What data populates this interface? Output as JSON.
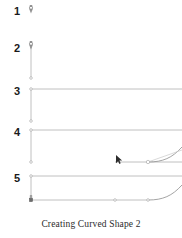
{
  "figure": {
    "caption": "Creating Curved Shape 2",
    "canvas": {
      "width": 182,
      "height": 238
    },
    "colors": {
      "line": "#b9b9b9",
      "line_dark": "#9a9a9a",
      "handle": "#c9c9c9",
      "anchor_fill": "#ffffff",
      "anchor_stroke": "#a0a0a0",
      "anchor_solid": "#6e6e6e",
      "cursor": "#2c2c2c",
      "number": "#1a1a1a",
      "caption": "#2b2b2b",
      "background": "#ffffff"
    },
    "steps": [
      {
        "number": "1",
        "label_x": 16,
        "label_y": 12,
        "description": "Pen tool placed at the starting point",
        "origin_x": 31,
        "origin_y": 11,
        "tool": "pen-tool",
        "has_vertical_line": false,
        "has_top_line": false,
        "has_bottom_line": false,
        "has_curve": false,
        "has_cursor": false
      },
      {
        "number": "2",
        "label_x": 16,
        "label_y": 50,
        "description": "Vertical line dragged downward from the start point",
        "origin_x": 31,
        "origin_y": 47,
        "vertical_end_y": 78,
        "tool": "pen-tool",
        "has_vertical_line": true,
        "has_top_line": false,
        "has_bottom_line": false,
        "has_curve": false,
        "has_cursor": false
      },
      {
        "number": "3",
        "label_x": 16,
        "label_y": 93,
        "description": "Horizontal top line added extending to the right edge",
        "origin_x": 31,
        "origin_y": 89,
        "vertical_end_y": 121,
        "top_line_end_x": 182,
        "tool": "anchor-point",
        "has_vertical_line": true,
        "has_top_line": true,
        "has_bottom_line": false,
        "has_curve": false,
        "has_cursor": false
      },
      {
        "number": "4",
        "label_x": 16,
        "label_y": 134,
        "description": "Bottom segment drawn and curve handle pulled up at the right",
        "origin_x": 31,
        "origin_y": 130,
        "vertical_end_y": 162,
        "top_line_end_x": 182,
        "bottom_line_start_x": 115,
        "bottom_line_end_x": 182,
        "bottom_line_y": 162,
        "curve_start_x": 148,
        "curve_end_x": 182,
        "curve_end_y": 150,
        "anchor_x": 148,
        "anchor_y": 162,
        "cursor_x": 117,
        "cursor_y": 157,
        "tool": "direct-selection-cursor",
        "has_vertical_line": true,
        "has_top_line": true,
        "has_bottom_line": true,
        "has_curve": true,
        "has_cursor": true
      },
      {
        "number": "5",
        "label_x": 16,
        "label_y": 180,
        "description": "Completed curved shape with anchor points along the bottom",
        "origin_x": 31,
        "origin_y": 176,
        "vertical_end_y": 200,
        "top_line_end_x": 182,
        "bottom_line_start_x": 31,
        "bottom_line_end_x": 182,
        "bottom_line_y": 200,
        "curve_start_x": 148,
        "curve_end_x": 182,
        "curve_end_y": 188,
        "anchor_points_x": [
          115,
          148
        ],
        "anchor_y": 200,
        "corner_anchor_x": 31,
        "corner_anchor_y": 200,
        "tool": "anchor-point",
        "has_vertical_line": true,
        "has_top_line": true,
        "has_bottom_line": true,
        "has_curve": true,
        "has_cursor": false
      }
    ]
  }
}
